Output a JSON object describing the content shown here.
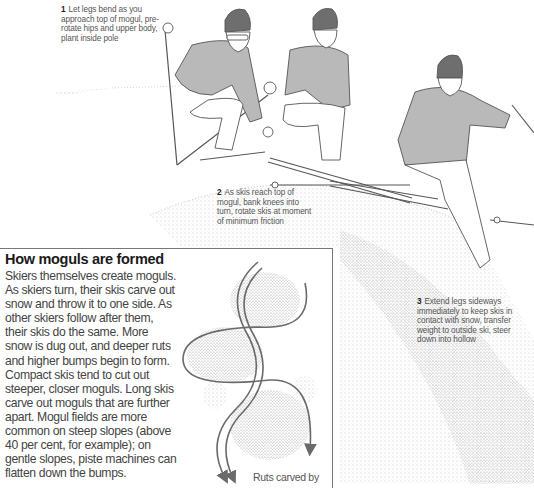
{
  "illustration": {
    "subject": "skier-sequence-over-mogul",
    "figures": 3,
    "colors": {
      "hat": "#6e6e6e",
      "sweater": "#b9b9b9",
      "outline": "#555555",
      "snow_stipple": "#8a8a8a",
      "arrow": "#6a6a6a",
      "box_border": "#777777"
    }
  },
  "captions": [
    {
      "number": "1",
      "text": "Let legs bend as you approach top of mogul, pre-rotate hips and upper body, plant inside pole"
    },
    {
      "number": "2",
      "text": "As skis reach top of mogul, bank knees into turn, rotate skis at moment of minimum friction"
    },
    {
      "number": "3",
      "text": "Extend legs sideways immediately to keep skis in contact with snow, transfer weight to outside ski, steer down into hollow"
    }
  ],
  "inset": {
    "title": "How moguls are formed",
    "body": "Skiers themselves create moguls. As skiers turn, their skis carve out snow and throw it to one side. As other skiers follow after them, their skis do the same. More snow is dug out, and deeper ruts and higher bumps begin to form. Compact skis tend to cut out steeper, closer moguls. Long skis carve out moguls that are further apart. Mogul fields are more common on steep slopes (above 40 per cent, for example); on gentle slopes, piste machines can flatten down the bumps.",
    "diagram_label": "Ruts carved by"
  }
}
